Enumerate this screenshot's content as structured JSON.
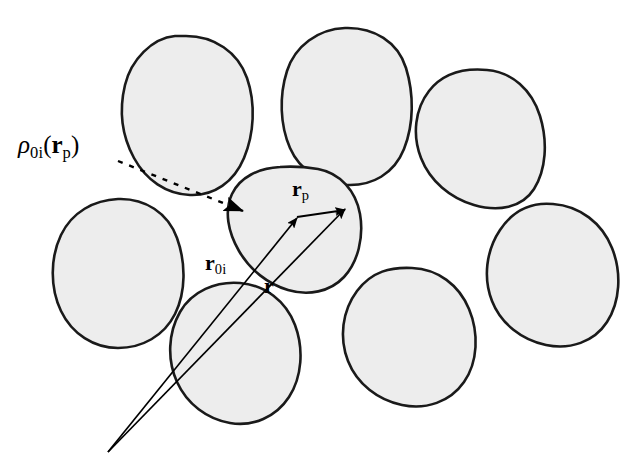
{
  "figure": {
    "kind": "vector-diagram",
    "background_color": "#ffffff",
    "grain_fill_color": "#ededed",
    "grain_stroke_color": "#1a1a1a",
    "vector_color": "#000000",
    "dashed_leader_color": "#000000"
  },
  "labels": {
    "density": {
      "symbol": "ρ",
      "symbol_sub": "0i",
      "open_paren": "(",
      "arg_symbol": "r",
      "arg_sub": "p",
      "close_paren": ")",
      "plain": "ρ_0i(r_p)"
    },
    "vector_rp": {
      "symbol": "r",
      "sub": "p",
      "plain": "r_p"
    },
    "vector_r0i": {
      "symbol": "r",
      "sub": "0i",
      "plain": "r_0i"
    },
    "vector_r": {
      "symbol": "r",
      "sub": "",
      "plain": "r"
    }
  },
  "geometry": {
    "origin": {
      "x": 108,
      "y": 452
    },
    "tip_r0i": {
      "x": 297,
      "y": 218
    },
    "tip_r": {
      "x": 345,
      "y": 209
    },
    "rp_start": {
      "x": 297,
      "y": 217
    },
    "rp_end": {
      "x": 345,
      "y": 210
    },
    "leader_start": {
      "x": 118,
      "y": 161
    },
    "leader_end": {
      "x": 246,
      "y": 212
    }
  },
  "grains": [
    {
      "id": "grain-top-left",
      "cx": 185,
      "cy": 112,
      "label": "grain 1"
    },
    {
      "id": "grain-top-center",
      "cx": 343,
      "cy": 103,
      "label": "grain 2"
    },
    {
      "id": "grain-top-right",
      "cx": 480,
      "cy": 136,
      "label": "grain 3"
    },
    {
      "id": "grain-mid-left",
      "cx": 117,
      "cy": 268,
      "label": "grain 4"
    },
    {
      "id": "grain-center",
      "cx": 295,
      "cy": 228,
      "label": "grain i (central)"
    },
    {
      "id": "grain-mid-right",
      "cx": 547,
      "cy": 270,
      "label": "grain 5"
    },
    {
      "id": "grain-bottom-left",
      "cx": 235,
      "cy": 350,
      "label": "grain 6"
    },
    {
      "id": "grain-bottom-center",
      "cx": 408,
      "cy": 335,
      "label": "grain 7"
    }
  ]
}
